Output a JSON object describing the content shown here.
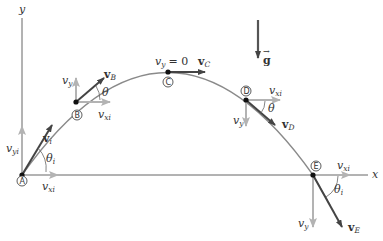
{
  "colors": {
    "axis": "#555555",
    "trajectory": "#888888",
    "velocity_vector": "#444444",
    "component_vector": "#b3b3b3",
    "point": "#111111",
    "background": "#ffffff"
  },
  "axes": {
    "x_label": "x",
    "y_label": "y"
  },
  "gravity": {
    "label": "g",
    "icon": "down-arrow"
  },
  "points": [
    {
      "id": "A",
      "label": "A",
      "vx_label": "v",
      "vx_sub": "xi",
      "vy_label": "v",
      "vy_sub": "yi",
      "v_label": "v",
      "v_sub": "i",
      "angle_label": "θ",
      "angle_sub": "i"
    },
    {
      "id": "B",
      "label": "B",
      "vx_label": "v",
      "vx_sub": "xi",
      "vy_label": "v",
      "vy_sub": "y",
      "v_label": "v",
      "v_sub": "B",
      "angle_label": "θ"
    },
    {
      "id": "C",
      "label": "C",
      "annotation": "= 0",
      "vy_label": "v",
      "vy_sub": "y",
      "v_label": "v",
      "v_sub": "C"
    },
    {
      "id": "D",
      "label": "D",
      "vx_label": "v",
      "vx_sub": "xi",
      "vy_label": "v",
      "vy_sub": "y",
      "v_label": "v",
      "v_sub": "D",
      "angle_label": "θ"
    },
    {
      "id": "E",
      "label": "E",
      "vx_label": "v",
      "vx_sub": "xi",
      "vy_label": "v",
      "vy_sub": "y",
      "v_label": "v",
      "v_sub": "E",
      "angle_label": "θ",
      "angle_sub": "i"
    }
  ]
}
